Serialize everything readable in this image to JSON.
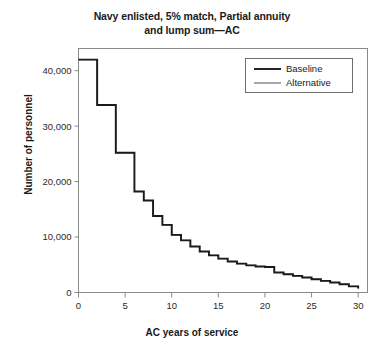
{
  "chart_data": {
    "type": "line",
    "title": "Navy enlisted, 5% match, Partial annuity\nand lump sum—AC",
    "xlabel": "AC years of service",
    "ylabel": "Number of personnel",
    "xlim": [
      0,
      31
    ],
    "ylim": [
      0,
      44000
    ],
    "xticks": [
      0,
      5,
      10,
      15,
      20,
      25,
      30
    ],
    "xticklabels": [
      "0",
      "5",
      "10",
      "15",
      "20",
      "25",
      "30"
    ],
    "yticks": [
      0,
      10000,
      20000,
      30000,
      40000
    ],
    "yticklabels": [
      "0",
      "10,000",
      "20,000",
      "30,000",
      "40,000"
    ],
    "grid": false,
    "drawstyle": "steps-post",
    "legend": {
      "position": "upper-right",
      "entries": [
        {
          "name": "Baseline",
          "color": "#1a1a1a",
          "width": 1.9
        },
        {
          "name": "Alternative",
          "color": "#6e6e6e",
          "width": 1.2
        }
      ]
    },
    "x": [
      0,
      1,
      2,
      3,
      4,
      5,
      6,
      7,
      8,
      9,
      10,
      11,
      12,
      13,
      14,
      15,
      16,
      17,
      18,
      19,
      20,
      21,
      22,
      23,
      24,
      25,
      26,
      27,
      28,
      29,
      30
    ],
    "series": [
      {
        "name": "Baseline",
        "color": "#1a1a1a",
        "values": [
          42000,
          42000,
          33800,
          33800,
          25200,
          25200,
          18200,
          16600,
          13800,
          12200,
          10400,
          9400,
          8300,
          7400,
          6700,
          6100,
          5600,
          5200,
          4900,
          4700,
          4600,
          3600,
          3300,
          3000,
          2700,
          2400,
          2100,
          1800,
          1500,
          1100,
          700
        ]
      },
      {
        "name": "Alternative",
        "color": "#6e6e6e",
        "values": [
          42000,
          42000,
          33800,
          33800,
          25200,
          25200,
          18200,
          16600,
          13800,
          12200,
          10400,
          9400,
          8300,
          7400,
          6700,
          6100,
          5600,
          5200,
          4900,
          4700,
          4600,
          3600,
          3300,
          3000,
          2700,
          2400,
          2100,
          1800,
          1500,
          1100,
          700
        ]
      }
    ]
  },
  "colors": {
    "axis": "#8a8a8a",
    "text": "#1a1a1a",
    "baseline": "#1a1a1a",
    "alternative": "#6e6e6e",
    "background": "#ffffff"
  }
}
